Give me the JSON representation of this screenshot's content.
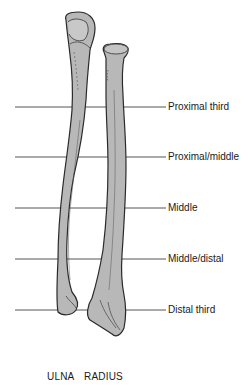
{
  "diagram": {
    "levels": [
      {
        "label": "Proximal third",
        "y": 107
      },
      {
        "label": "Proximal/middle",
        "y": 157
      },
      {
        "label": "Middle",
        "y": 208
      },
      {
        "label": "Middle/distal",
        "y": 259
      },
      {
        "label": "Distal third",
        "y": 310
      }
    ],
    "bones": [
      {
        "label": "ULNA"
      },
      {
        "label": "RADIUS"
      }
    ],
    "colors": {
      "bone_fill": "#b8b8b8",
      "bone_outline": "#2a2a2a",
      "line": "#555555",
      "text": "#1a1a1a"
    }
  }
}
